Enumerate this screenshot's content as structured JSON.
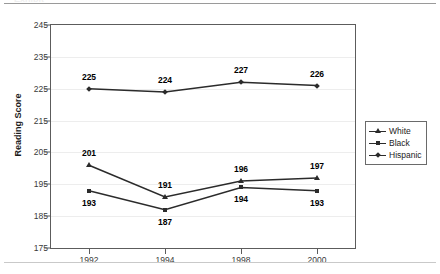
{
  "ghost_title_fragment": "Exhibit",
  "chart_data": {
    "type": "line",
    "title": "",
    "xlabel": "",
    "ylabel": "Reading Score",
    "categories": [
      "1992",
      "1994",
      "1998",
      "2000"
    ],
    "ylim": [
      175,
      245
    ],
    "yticks": [
      245,
      235,
      225,
      215,
      205,
      195,
      185,
      175
    ],
    "grid": true,
    "legend_position": "right",
    "series": [
      {
        "name": "White",
        "marker": "triangle",
        "color": "#2b2b2b",
        "values": [
          201,
          191,
          196,
          197
        ],
        "labels": [
          "201",
          "191",
          "196",
          "197"
        ],
        "label_side": [
          "above",
          "above",
          "above",
          "above"
        ]
      },
      {
        "name": "Black",
        "marker": "square",
        "color": "#2b2b2b",
        "values": [
          193,
          187,
          194,
          193
        ],
        "labels": [
          "193",
          "187",
          "194",
          "193"
        ],
        "label_side": [
          "below",
          "below",
          "below",
          "below"
        ]
      },
      {
        "name": "Hispanic",
        "marker": "diamond",
        "color": "#2b2b2b",
        "values": [
          225,
          224,
          227,
          226
        ],
        "labels": [
          "225",
          "224",
          "227",
          "226"
        ],
        "label_side": [
          "above",
          "above",
          "above",
          "above"
        ]
      }
    ]
  }
}
